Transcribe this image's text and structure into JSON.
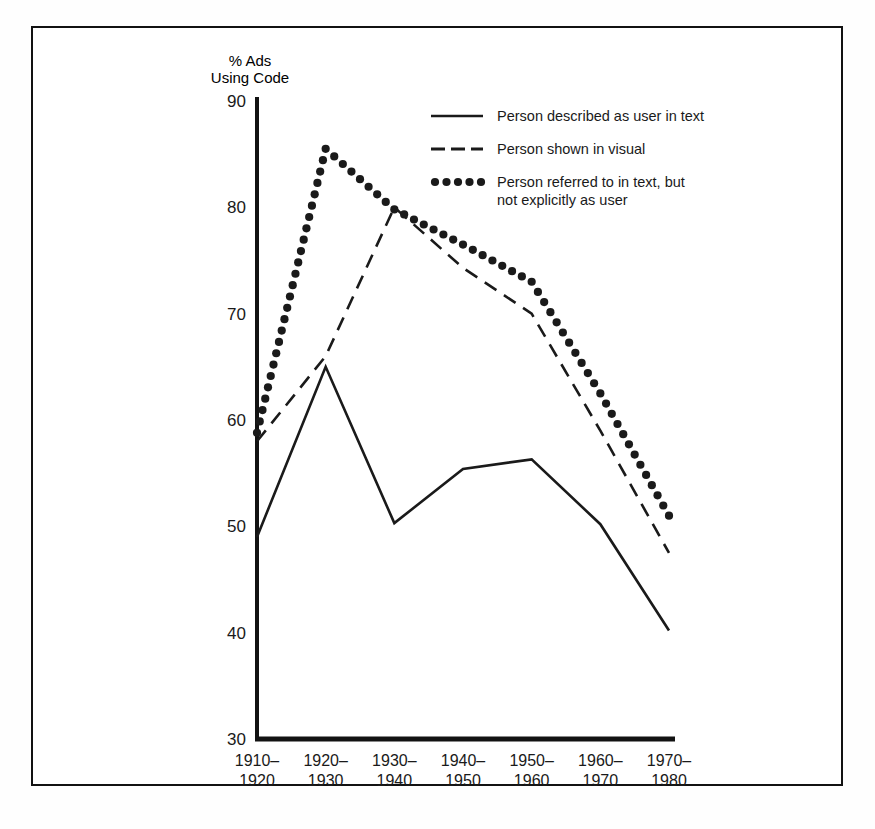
{
  "figure": {
    "frame_color": "#121212",
    "background": "#ffffff"
  },
  "chart_data": {
    "type": "line",
    "title": "",
    "subtitle": "",
    "ylabel_line1": "% Ads",
    "ylabel_line2": "Using Code",
    "xlabel": "",
    "ylim": [
      30,
      90
    ],
    "yticks": [
      30,
      40,
      50,
      60,
      70,
      80,
      90
    ],
    "ytick_labels": [
      "30",
      "40",
      "50",
      "60",
      "70",
      "80",
      "90"
    ],
    "grid": false,
    "legend_position": "top-right-inside",
    "categories": [
      "1910-\n1920",
      "1920-\n1930",
      "1930-\n1940",
      "1940-\n1950",
      "1950-\n1960",
      "1960-\n1970",
      "1970-\n1980"
    ],
    "category_lines": [
      [
        "1910–",
        "1920"
      ],
      [
        "1920–",
        "1930"
      ],
      [
        "1930–",
        "1940"
      ],
      [
        "1940–",
        "1950"
      ],
      [
        "1950–",
        "1960"
      ],
      [
        "1960–",
        "1970"
      ],
      [
        "1970–",
        "1980"
      ]
    ],
    "series": [
      {
        "name": "Person described as user in text",
        "style": "solid",
        "color": "#1a1a1a",
        "values": [
          49.0,
          65.0,
          50.3,
          55.4,
          56.3,
          50.2,
          40.2
        ]
      },
      {
        "name": "Person shown in visual",
        "style": "dashed",
        "color": "#1a1a1a",
        "values": [
          58.0,
          66.0,
          80.0,
          74.3,
          70.0,
          59.0,
          47.5
        ]
      },
      {
        "name": "Person referred to in text, but not explicitly as user",
        "style": "dotted",
        "color": "#1a1a1a",
        "values": [
          58.8,
          85.5,
          79.8,
          76.5,
          73.0,
          62.5,
          51.0
        ]
      }
    ]
  },
  "legend": {
    "entries": [
      {
        "style": "solid",
        "lines": [
          "Person described as user in text"
        ]
      },
      {
        "style": "dashed",
        "lines": [
          "Person shown in visual"
        ]
      },
      {
        "style": "dotted",
        "lines": [
          "Person referred to in text, but",
          "not explicitly as user"
        ]
      }
    ]
  }
}
